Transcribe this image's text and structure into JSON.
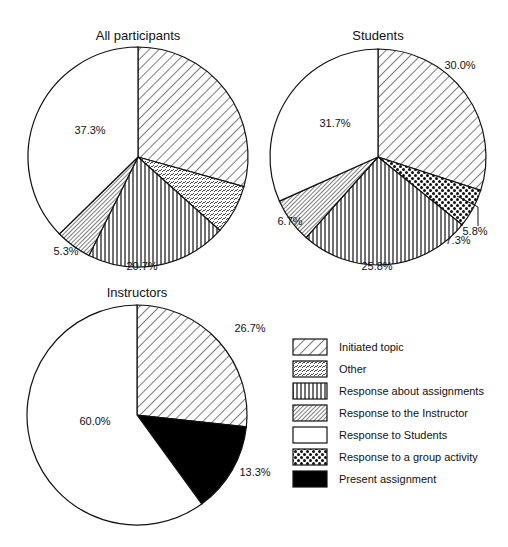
{
  "chart_data": [
    {
      "type": "pie",
      "title": "All participants",
      "slices": [
        {
          "label": "Initiated topic",
          "value": 29.3,
          "display": "29.3%"
        },
        {
          "label": "Other",
          "value": 7.3,
          "display": "7.3%"
        },
        {
          "label": "Response about assignments",
          "value": 20.7,
          "display": "20.7%"
        },
        {
          "label": "Response to the Instructor",
          "value": 5.3,
          "display": "5.3%"
        },
        {
          "label": "Response to Students",
          "value": 37.3,
          "display": "37.3%"
        }
      ]
    },
    {
      "type": "pie",
      "title": "Students",
      "slices": [
        {
          "label": "Initiated topic",
          "value": 30.0,
          "display": "30.0%"
        },
        {
          "label": "Response to a group activity",
          "value": 5.8,
          "display": "5.8%"
        },
        {
          "label": "Response about assignments",
          "value": 25.8,
          "display": "25.8%"
        },
        {
          "label": "Response to the Instructor",
          "value": 6.7,
          "display": "6.7%"
        },
        {
          "label": "Response to Students",
          "value": 31.7,
          "display": "31.7%"
        }
      ]
    },
    {
      "type": "pie",
      "title": "Instructors",
      "slices": [
        {
          "label": "Initiated topic",
          "value": 26.7,
          "display": "26.7%"
        },
        {
          "label": "Present assignment",
          "value": 13.3,
          "display": "13.3%"
        },
        {
          "label": "Response to Students",
          "value": 60.0,
          "display": "60.0%"
        }
      ]
    }
  ],
  "legend": {
    "position": "bottom-right",
    "items": [
      {
        "label": "Initiated topic",
        "pattern": "diag-wide"
      },
      {
        "label": "Other",
        "pattern": "dashes"
      },
      {
        "label": "Response about assignments",
        "pattern": "vertical"
      },
      {
        "label": "Response to the Instructor",
        "pattern": "diag-dense"
      },
      {
        "label": "Response to Students",
        "pattern": "blank"
      },
      {
        "label": "Response to a group activity",
        "pattern": "checker"
      },
      {
        "label": "Present assignment",
        "pattern": "solid-black"
      }
    ]
  },
  "pies": [
    {
      "cx": 138,
      "cy": 157,
      "r": 110,
      "title_y": 40,
      "label_pos": [
        [
          446,
          97
        ],
        [
          458,
          244
        ],
        [
          142,
          270
        ],
        [
          66,
          255
        ],
        [
          90,
          134
        ]
      ]
    },
    {
      "cx": 378,
      "cy": 157,
      "r": 108,
      "title_y": 40,
      "label_pos": [
        [
          460,
          69
        ],
        [
          475,
          235
        ],
        [
          377,
          270
        ],
        [
          290,
          225
        ],
        [
          335,
          127
        ]
      ]
    },
    {
      "cx": 137,
      "cy": 415,
      "r": 110,
      "title_y": 297,
      "label_pos": [
        [
          250,
          332
        ],
        [
          255,
          476
        ],
        [
          95,
          425
        ]
      ]
    }
  ]
}
